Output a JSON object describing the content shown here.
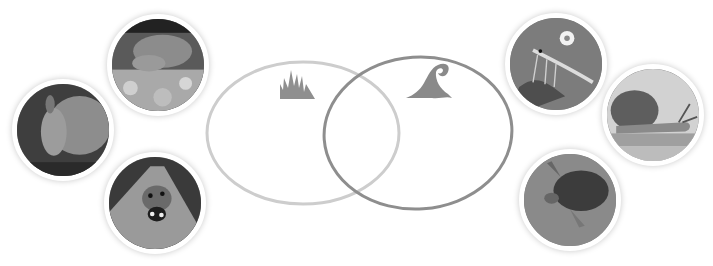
{
  "diagram": {
    "type": "venn",
    "sets": [
      {
        "name": "land",
        "icon": "grass-icon",
        "stroke": "#c8c8c8"
      },
      {
        "name": "water",
        "icon": "wave-icon",
        "stroke": "#8a8a8a"
      }
    ],
    "icon_color": "#8c8c8c"
  },
  "photos": {
    "left": [
      {
        "id": "crab",
        "label": "crab"
      },
      {
        "id": "armadillo",
        "label": "armadillo"
      },
      {
        "id": "ladybug",
        "label": "ladybug"
      }
    ],
    "right": [
      {
        "id": "shrimp",
        "label": "shrimp"
      },
      {
        "id": "snail",
        "label": "snail"
      },
      {
        "id": "turtle",
        "label": "turtle"
      }
    ]
  }
}
